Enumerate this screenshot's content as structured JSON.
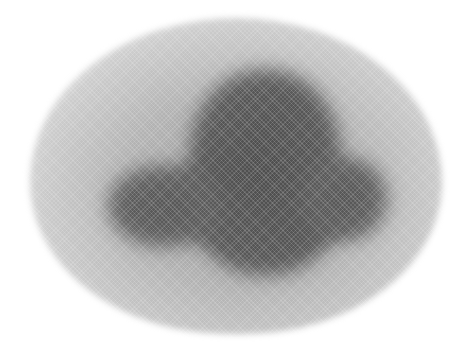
{
  "image": {
    "description": "Halftone grayscale image of a diffuse blob: a light gray oval halo surrounding a dark gray cross/cloud-shaped core with left and right lateral lobes",
    "width": 460,
    "height": 347,
    "colors": {
      "background": "#ffffff",
      "halo_center": "#9a9a9a",
      "halo_edge": "#e2e2e2",
      "core": "#555555"
    },
    "regions": [
      {
        "name": "halo",
        "shape": "ellipse",
        "bounds": [
          30,
          18,
          442,
          334
        ]
      },
      {
        "name": "core-body",
        "shape": "rounded-vertical",
        "bounds": [
          190,
          70,
          340,
          275
        ]
      },
      {
        "name": "core-left-lobe",
        "shape": "ellipse",
        "bounds": [
          108,
          165,
          218,
          247
        ]
      },
      {
        "name": "core-right-lobe",
        "shape": "ellipse",
        "bounds": [
          305,
          158,
          387,
          240
        ]
      }
    ]
  }
}
